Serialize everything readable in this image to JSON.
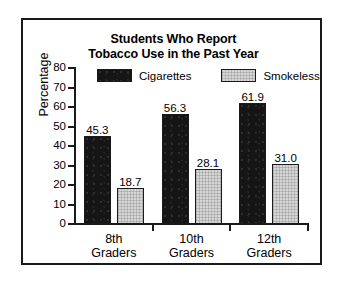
{
  "chart_data": {
    "type": "bar",
    "title": "Students Who Report Tobacco Use in the Past Year",
    "title_lines": [
      "Students Who Report",
      "Tobacco Use in the Past Year"
    ],
    "categories": [
      "8th Graders",
      "10th Graders",
      "12th Graders"
    ],
    "category_lines": [
      [
        "8th",
        "Graders"
      ],
      [
        "10th",
        "Graders"
      ],
      [
        "12th",
        "Graders"
      ]
    ],
    "series": [
      {
        "name": "Cigarettes",
        "values": [
          45.3,
          56.3,
          61.9
        ],
        "color": "#151515"
      },
      {
        "name": "Smokeless",
        "values": [
          18.7,
          28.1,
          31.0
        ],
        "color": "#d6d6d6"
      }
    ],
    "value_labels": [
      [
        "45.3",
        "56.3",
        "61.9"
      ],
      [
        "18.7",
        "28.1",
        "31.0"
      ]
    ],
    "xlabel": "",
    "ylabel": "Percentage",
    "ylim": [
      0,
      80
    ],
    "yticks": [
      0,
      10,
      20,
      30,
      40,
      50,
      60,
      70,
      80
    ],
    "ytick_labels": [
      "0",
      "10",
      "20",
      "30",
      "40",
      "50",
      "60",
      "70",
      "80"
    ],
    "grid": false,
    "legend_position": "top-inside",
    "legend": [
      "Cigarettes",
      "Smokeless"
    ],
    "frame_color": "#1a1a1a",
    "background": "#ffffff"
  }
}
